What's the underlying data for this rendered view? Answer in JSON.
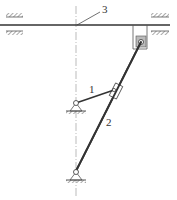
{
  "diagram": {
    "type": "mechanism-kinematic-sketch",
    "labels": {
      "link1": "1",
      "link2": "2",
      "rod3": "3"
    },
    "colors": {
      "line": "#333333",
      "hatch": "#666666",
      "centerline": "#999999",
      "background": "#ffffff"
    },
    "components": [
      {
        "id": "1",
        "description": "crank link from fixed pivot to slider on link 2"
      },
      {
        "id": "2",
        "description": "rocker link from lower fixed pivot to slider block on rod 3"
      },
      {
        "id": "3",
        "description": "horizontal sliding rod in fixed guides"
      }
    ]
  }
}
